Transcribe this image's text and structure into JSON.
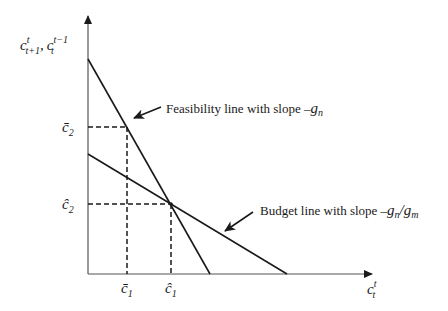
{
  "diagram": {
    "y_axis_label": {
      "base1": "c",
      "sup1": "t",
      "sub1": "t+1",
      "sep": ",",
      "base2": "c",
      "sup2": "t−1",
      "sub2": "t"
    },
    "x_axis_label": {
      "base": "c",
      "sup": "t",
      "sub": "t"
    },
    "y_ticks": [
      {
        "id": "cbar2",
        "base": "c̄",
        "sub": "2"
      },
      {
        "id": "chat2",
        "base": "ĉ",
        "sub": "2"
      }
    ],
    "x_ticks": [
      {
        "id": "cbar1",
        "base": "c̄",
        "sub": "1"
      },
      {
        "id": "chat1",
        "base": "ĉ",
        "sub": "1"
      }
    ],
    "feasibility_label": {
      "text": "Feasibility line with slope ",
      "minus": "–",
      "g": "g",
      "sub": "n"
    },
    "budget_label": {
      "text": "Budget line with slope ",
      "minus": "–",
      "g1": "g",
      "sub1": "n",
      "slash": "/",
      "g2": "g",
      "sub2": "m"
    },
    "colors": {
      "line": "#1a1a1a",
      "axis": "#555555"
    }
  }
}
